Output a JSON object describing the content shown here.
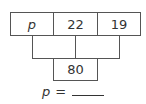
{
  "pyramid": {
    "row1": [
      "p",
      "22",
      "19"
    ],
    "row2": [
      "",
      ""
    ],
    "row3": [
      "80"
    ]
  },
  "answer": {
    "variable": "p",
    "equals": "="
  }
}
